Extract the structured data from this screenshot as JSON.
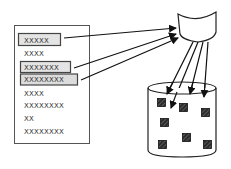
{
  "diagram": {
    "list_panel": {
      "items": [
        {
          "label": "XXXXX",
          "highlighted": true
        },
        {
          "label": "XXXX",
          "highlighted": false
        },
        {
          "label": "XXXXXXX",
          "highlighted": true
        },
        {
          "label": "XXXXXXXX",
          "highlighted": true
        },
        {
          "label": "XXXX",
          "highlighted": false
        },
        {
          "label": "XXXXXXXX",
          "highlighted": false
        },
        {
          "label": "XX",
          "highlighted": false
        },
        {
          "label": "XXXXXXXX",
          "highlighted": false
        }
      ]
    },
    "collector": {
      "shape": "cup"
    },
    "storage": {
      "shape": "cylinder",
      "block_count": 7
    },
    "colors": {
      "stroke": "#222222",
      "panel_border": "#555555",
      "highlight_fill": "#e4e4e4",
      "block_fill": "#333333"
    }
  }
}
